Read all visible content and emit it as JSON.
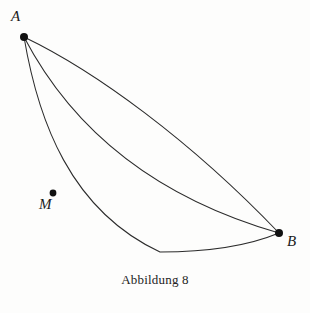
{
  "figure": {
    "caption": "Abbildung 8",
    "background_color": "#fdfdfc",
    "stroke_color": "#2b2b2b",
    "point_color": "#111111",
    "width": 310,
    "height": 313
  },
  "points": [
    {
      "id": "A",
      "label": "A",
      "x": 24,
      "y": 37,
      "label_x": 14,
      "label_y": 22
    },
    {
      "id": "B",
      "label": "B",
      "x": 279,
      "y": 233,
      "label_x": 290,
      "label_y": 247
    },
    {
      "id": "M",
      "label": "M",
      "x": 53,
      "y": 193,
      "label_x": 42,
      "label_y": 210
    }
  ],
  "curves": [
    {
      "id": "upper-path",
      "name": "straight-chord-path",
      "from": "A",
      "to": "B",
      "description": "nearly straight chord from A to B, bowing slightly upward",
      "path": "M 24 37 C 95 71 190 140 279 233"
    },
    {
      "id": "middle-path",
      "name": "circular-arc-path",
      "from": "A",
      "to": "B",
      "description": "arc from A sagging below the chord, meeting B from the left",
      "path": "M 24 37 C 70 125 150 196 279 233"
    },
    {
      "id": "lower-path",
      "name": "cycloid-path",
      "from": "A",
      "to": "B",
      "description": "cycloid (brachistochrone) from A dipping below B and rising back to B, passes through M",
      "path": "M 24 37 C 38 120 70 210 160 252 C 215 252 255 243 279 233"
    }
  ],
  "chart_data": {
    "type": "line",
    "title": "Abbildung 8",
    "xlabel": "",
    "ylabel": "",
    "annotations": [
      "A",
      "M",
      "B"
    ],
    "series": [
      {
        "name": "straight-chord-path",
        "points": [
          [
            24,
            37
          ],
          [
            95,
            71
          ],
          [
            190,
            140
          ],
          [
            279,
            233
          ]
        ]
      },
      {
        "name": "circular-arc-path",
        "points": [
          [
            24,
            37
          ],
          [
            70,
            125
          ],
          [
            150,
            196
          ],
          [
            279,
            233
          ]
        ]
      },
      {
        "name": "cycloid-path",
        "points": [
          [
            24,
            37
          ],
          [
            53,
            193
          ],
          [
            160,
            252
          ],
          [
            215,
            252
          ],
          [
            279,
            233
          ]
        ]
      }
    ]
  }
}
